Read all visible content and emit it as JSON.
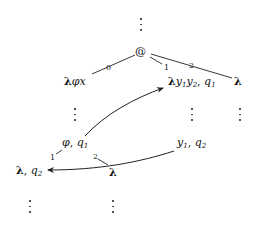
{
  "diagram": {
    "root": {
      "label": "@"
    },
    "nodes": {
      "lam_phi_x": {
        "lambda": "λ",
        "rest": "φx"
      },
      "lam_y1y2": {
        "lambda": "λ",
        "y1": "y",
        "y1_sub": "1",
        "y2": "y",
        "y2_sub": "2",
        "sep": ", ",
        "q": "q",
        "q_sub": "1"
      },
      "lam_right": {
        "lambda": "λ"
      },
      "phi_q1": {
        "phi": "φ",
        "sep": ", ",
        "q": "q",
        "q_sub": "1"
      },
      "y1_q2": {
        "y": "y",
        "y_sub": "1",
        "sep": ", ",
        "q": "q",
        "q_sub": "2"
      },
      "lam_q2": {
        "lambda": "λ",
        "sep": ", ",
        "q": "q",
        "q_sub": "2"
      },
      "lam_mid": {
        "lambda": "λ"
      }
    },
    "edge_labels": {
      "root_to_lam_phi_x": "0",
      "root_to_lam_y1y2": "1",
      "root_to_lam_right": "2",
      "phi_to_lam_q2": "1",
      "phi_to_lam_mid": "2"
    },
    "arrows": [
      {
        "from": "φ, q1",
        "to": "λy1y2, q1"
      },
      {
        "from": "y1, q2",
        "to": "λ, q2"
      }
    ],
    "ellipsis": "⋮"
  }
}
